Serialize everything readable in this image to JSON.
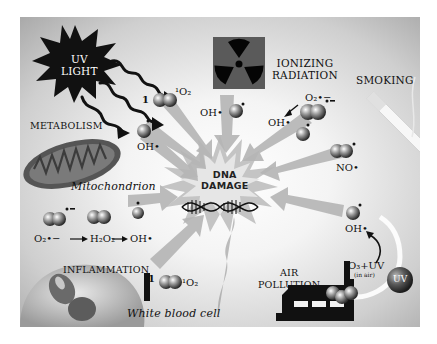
{
  "figure": {
    "center": {
      "line1": "DNA",
      "line2": "DAMAGE",
      "icon": "dna-helix-icon"
    },
    "sources": [
      {
        "id": "uv-light",
        "label_line1": "UV",
        "label_line2": "LIGHT",
        "icon": "starburst-icon"
      },
      {
        "id": "ionizing-radiation",
        "label_line1": "IONIZING",
        "label_line2": "RADIATION",
        "icon": "radiation-icon"
      },
      {
        "id": "smoking",
        "label": "SMOKING",
        "icon": "cigarette-icon"
      },
      {
        "id": "metabolism",
        "label": "METABOLISM",
        "sublabel": "Mitochondrion",
        "icon": "mitochondrion-icon"
      },
      {
        "id": "inflammation",
        "label": "INFLAMMATION",
        "sublabel": "White blood cell",
        "icon": "white-blood-cell-icon"
      },
      {
        "id": "air-pollution",
        "label_line1": "AIR",
        "label_line2": "POLLUTION",
        "icon": "factory-icon",
        "uv_badge": "UV"
      }
    ],
    "species": {
      "singlet_o2_top_prefix": "1",
      "singlet_o2_top": "¹O₂",
      "oh_radical_uv": "OH•",
      "oh_radical_ionizing": "OH•",
      "superoxide_smoking": "O₂•−",
      "oh_radical_smoking": "OH•",
      "no_radical": "NO•",
      "oh_radical_pollution": "OH•",
      "ozone_uv": "O₃+UV",
      "in_air": "(in air)",
      "inflammation_chain": {
        "a": "O₂•−",
        "b": "H₂O₂",
        "c": "OH•"
      },
      "singlet_o2_bottom_prefix": "1",
      "singlet_o2_bottom": "¹O₂"
    },
    "colors": {
      "background_center": "#ffffff",
      "background_edge": "#a9a9a9",
      "arrow": "#b5b5b5",
      "icon_dark": "#111111",
      "radiation_box": "#5a5a5a",
      "mitochondrion": "#6a6a6a"
    }
  }
}
